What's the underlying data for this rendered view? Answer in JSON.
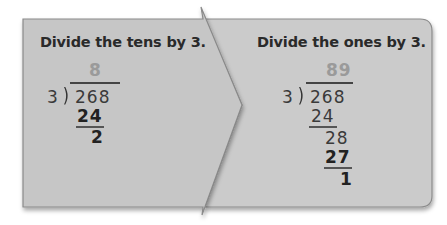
{
  "colors": {
    "panel_fill": "#c9c9c9",
    "panel_edge": "#8a8a8a",
    "quotient": "#9a9a9a",
    "text": "#2a2a2a"
  },
  "left_panel": {
    "title": "Divide the tens by 3.",
    "quotient": "8",
    "divisor": "3",
    "dividend": "268",
    "steps": [
      {
        "value": "24",
        "bold": true
      },
      {
        "value": "2",
        "bold": true
      }
    ]
  },
  "right_panel": {
    "title": "Divide the ones by 3.",
    "quotient": "89",
    "divisor": "3",
    "dividend": "268",
    "steps": [
      {
        "value": "24",
        "bold": false
      },
      {
        "value": "28",
        "bold": false
      },
      {
        "value": "27",
        "bold": true
      },
      {
        "value": "1",
        "bold": true
      }
    ]
  }
}
